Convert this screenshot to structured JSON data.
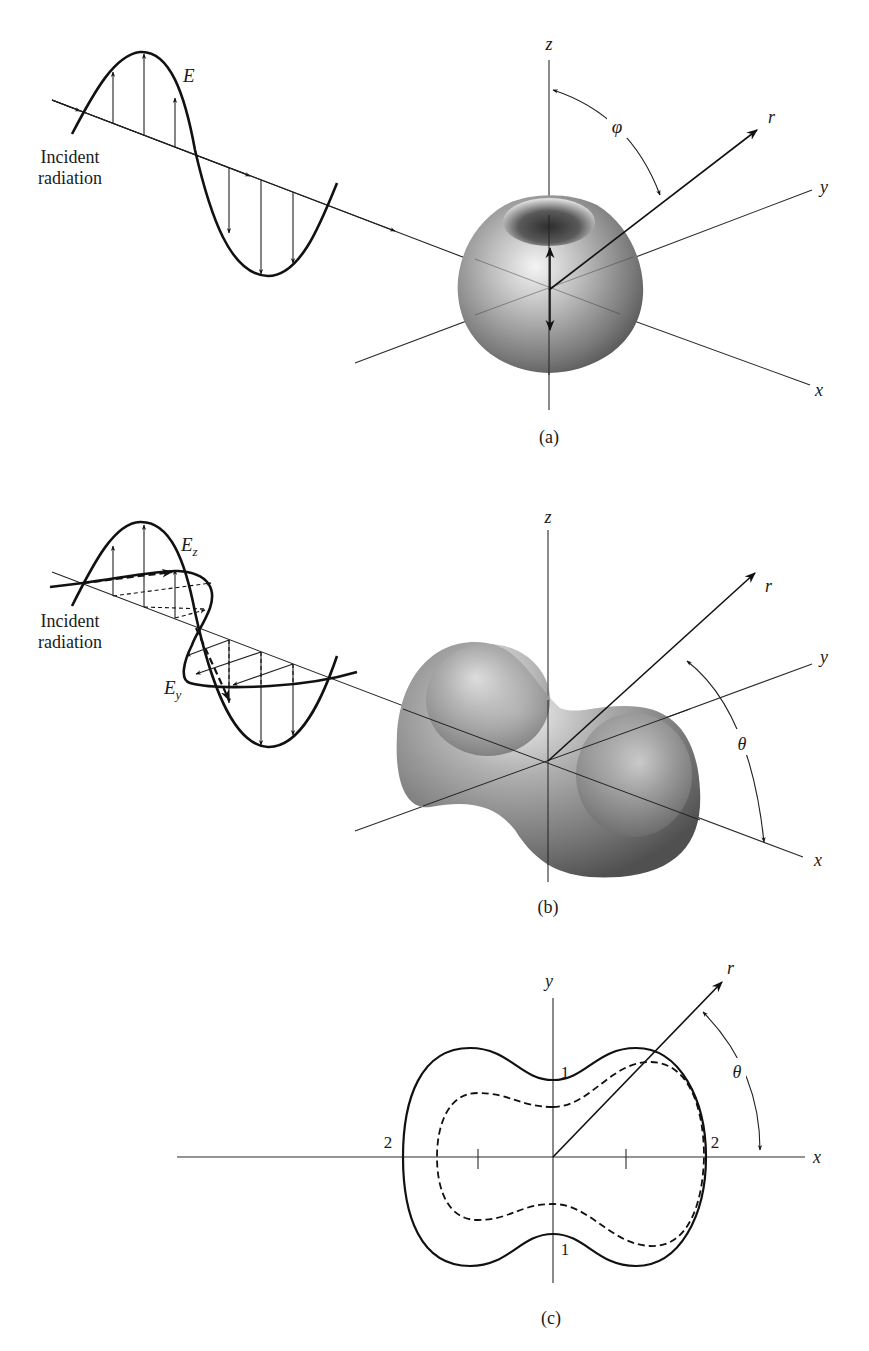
{
  "panels": [
    {
      "id": "a",
      "caption": "(a)",
      "incident_label_line1": "Incident",
      "incident_label_line2": "radiation",
      "field_label": "E",
      "axis_labels": {
        "z": "z",
        "y": "y",
        "x": "x",
        "r": "r"
      },
      "angle_label": "φ",
      "shape": "torus (dipole radiation pattern)"
    },
    {
      "id": "b",
      "caption": "(b)",
      "incident_label_line1": "Incident",
      "incident_label_line2": "radiation",
      "field_label_z": "E",
      "field_label_z_sub": "z",
      "field_label_y": "E",
      "field_label_y_sub": "y",
      "axis_labels": {
        "z": "z",
        "y": "y",
        "x": "x",
        "r": "r"
      },
      "angle_label": "θ",
      "shape": "peanut (unpolarized scattering pattern)"
    },
    {
      "id": "c",
      "caption": "(c)",
      "axis_labels": {
        "y": "y",
        "x": "x",
        "r": "r"
      },
      "angle_label": "θ",
      "tick_labels": {
        "left_x": "2",
        "right_x": "2",
        "top_y": "1",
        "bottom_y": "1"
      },
      "curves": [
        "solid outer contour",
        "dashed inner contour"
      ]
    }
  ],
  "colors": {
    "line": "#111111",
    "shape_light": "#f2f2f2",
    "shape_mid": "#9a9a9a",
    "shape_dark": "#4a4a4a",
    "background": "#ffffff"
  }
}
